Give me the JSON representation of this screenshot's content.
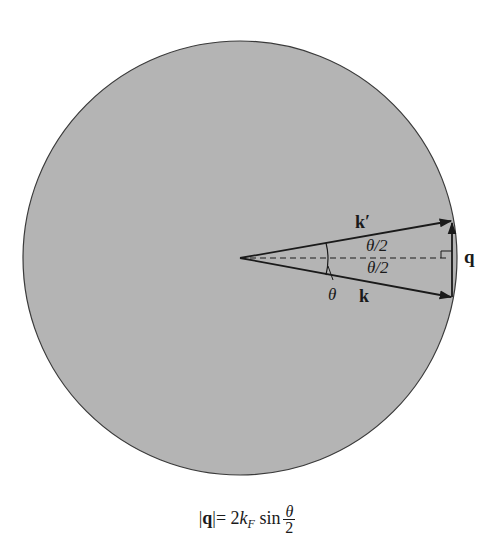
{
  "figure": {
    "type": "fermi-sphere-scattering-diagram",
    "sphere": {
      "center": [
        240,
        258
      ],
      "radius": 217,
      "fill": "#b4b4b4",
      "stroke": "#3a3a3a"
    },
    "vectors": [
      {
        "name": "k_prime",
        "label": "k′",
        "from": [
          240,
          258
        ],
        "to": [
          452,
          221
        ]
      },
      {
        "name": "k",
        "label": "k",
        "from": [
          240,
          258
        ],
        "to": [
          452,
          297
        ]
      },
      {
        "name": "q",
        "label": "q",
        "from": [
          452,
          297
        ],
        "to": [
          452,
          221
        ]
      }
    ],
    "bisector": {
      "style": "dashed",
      "from": [
        240,
        258
      ],
      "to": [
        452,
        258
      ]
    }
  },
  "labels": {
    "k_prime": "k′",
    "k": "k",
    "q": "q",
    "theta": "θ",
    "half_angle_top": "θ/2",
    "half_angle_bottom": "θ/2"
  },
  "caption": {
    "lhs_open": "|",
    "lhs_q": "q",
    "lhs_close": "|",
    "equals": "= 2",
    "k": "k",
    "sub": "F",
    "sin": "sin",
    "num": "θ",
    "den": "2"
  }
}
